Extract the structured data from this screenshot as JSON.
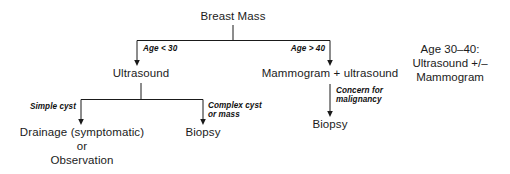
{
  "diagram": {
    "title": "Breast Mass",
    "type": "clinical-decision-flowchart",
    "line_color": "#1a1a1a",
    "background_color": "#ffffff",
    "nodes": {
      "root": "Breast Mass",
      "ultrasound": "Ultrasound",
      "mammogram_ultrasound": "Mammogram + ultrasound",
      "drainage_line1": "Drainage (symptomatic)",
      "drainage_line2": "or",
      "drainage_line3": "Observation",
      "biopsy_left": "Biopsy",
      "biopsy_right": "Biopsy"
    },
    "edge_labels": {
      "age_under_30": "Age < 30",
      "age_over_40": "Age > 40",
      "simple_cyst": "Simple cyst",
      "complex_cyst_line1": "Complex cyst",
      "complex_cyst_line2": "or mass",
      "concern_line1": "Concern for",
      "concern_line2": "malignancy"
    },
    "side_note": {
      "line1": "Age 30–40:",
      "line2": "Ultrasound +/–",
      "line3": "Mammogram"
    }
  }
}
